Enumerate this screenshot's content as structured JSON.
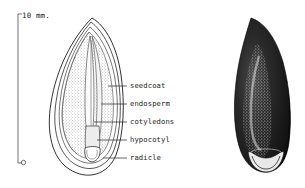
{
  "figure": {
    "background_color": "#ffffff",
    "ink_color": "#1c1c1c",
    "scale": {
      "name": "scale-bar",
      "value": "10",
      "unit": "mm.",
      "text": "10 mm.",
      "orientation": "vertical"
    },
    "panels": [
      {
        "name": "longitudinal-section",
        "description": "Cut-away longitudinal section of seed showing internal parts",
        "shading": "stipple"
      },
      {
        "name": "whole-seed",
        "description": "Exterior view of whole dark seed with hilum scar",
        "shading": "solid-dark"
      }
    ],
    "labels": [
      {
        "id": "seedcoat",
        "text": "seedcoat",
        "leader_y": 86
      },
      {
        "id": "endosperm",
        "text": "endosperm",
        "leader_y": 104
      },
      {
        "id": "cotyledons",
        "text": "cotyledons",
        "leader_y": 122
      },
      {
        "id": "hypocotyl",
        "text": "hypocotyl",
        "leader_y": 140
      },
      {
        "id": "radicle",
        "text": "radicle",
        "leader_y": 158
      }
    ]
  }
}
